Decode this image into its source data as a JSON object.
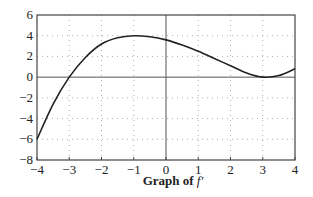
{
  "chart_data": {
    "type": "line",
    "title": "Graph of f′",
    "caption_bold": "Graph of ",
    "caption_italic": "f′",
    "xlabel": "",
    "ylabel": "",
    "xlim": [
      -4,
      4
    ],
    "ylim": [
      -8,
      6
    ],
    "x_ticks": [
      -4,
      -3,
      -2,
      -1,
      0,
      1,
      2,
      3,
      4
    ],
    "y_ticks": [
      -8,
      -6,
      -4,
      -2,
      0,
      2,
      4,
      6
    ],
    "grid": "dotted",
    "series": [
      {
        "name": "f′",
        "x": [
          -4,
          -3.5,
          -3,
          -2.5,
          -2,
          -1.5,
          -1,
          -0.5,
          0,
          0.5,
          1,
          1.5,
          2,
          2.5,
          3,
          3.5,
          4
        ],
        "values": [
          -6,
          -2.6,
          0,
          1.9,
          3.2,
          3.8,
          4,
          3.9,
          3.6,
          3.1,
          2.5,
          1.8,
          1.1,
          0.4,
          0,
          0.15,
          0.8
        ]
      }
    ],
    "key_points": {
      "zeros": [
        -3,
        3
      ],
      "local_max": {
        "x": -1,
        "y": 4
      },
      "local_min": {
        "x": 3,
        "y": 0
      },
      "endpoints": [
        {
          "x": -4,
          "y": -6
        },
        {
          "x": 4,
          "y": 0.8
        }
      ]
    }
  },
  "caption": {
    "bold": "Graph of ",
    "italic": "f′"
  }
}
